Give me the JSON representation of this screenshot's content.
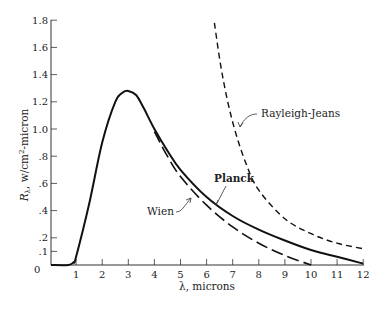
{
  "chart_data": {
    "type": "line",
    "title": "",
    "xlabel": "λ, microns",
    "ylabel": "Rλ, w/cm²-micron",
    "xlim": [
      0,
      12
    ],
    "ylim": [
      0,
      1.8
    ],
    "grid": false,
    "x_ticks": [
      "0",
      "1",
      "2",
      "3",
      "4",
      "5",
      "6",
      "7",
      "8",
      "9",
      "10",
      "11",
      "12"
    ],
    "y_ticks": [
      ".1",
      ".2",
      ".4",
      ".6",
      ".8",
      "1.0",
      "1.2",
      "1.4",
      "1.6",
      "1.8"
    ],
    "y_tick_values": [
      0.1,
      0.2,
      0.4,
      0.6,
      0.8,
      1.0,
      1.2,
      1.4,
      1.6,
      1.8
    ],
    "series": [
      {
        "name": "Planck",
        "style": "solid",
        "x": [
          0.7,
          0.9,
          1.0,
          1.5,
          2.0,
          2.5,
          2.8,
          3.0,
          3.3,
          3.6,
          4.0,
          4.5,
          5.0,
          6.0,
          7.0,
          8.0,
          9.0,
          10.0,
          11.0,
          12.0
        ],
        "y": [
          0.0,
          0.02,
          0.06,
          0.45,
          0.9,
          1.2,
          1.27,
          1.28,
          1.25,
          1.15,
          1.0,
          0.84,
          0.7,
          0.5,
          0.36,
          0.26,
          0.18,
          0.11,
          0.06,
          0.01
        ]
      },
      {
        "name": "Wien",
        "style": "long-dash",
        "x": [
          4.0,
          4.5,
          5.0,
          6.0,
          7.0,
          8.0,
          9.0,
          10.0
        ],
        "y": [
          0.98,
          0.8,
          0.65,
          0.44,
          0.28,
          0.16,
          0.07,
          0.0
        ]
      },
      {
        "name": "Rayleigh-Jeans",
        "style": "short-dash",
        "x": [
          6.3,
          6.6,
          7.0,
          7.5,
          8.0,
          9.0,
          10.0,
          11.0,
          12.0
        ],
        "y": [
          1.78,
          1.4,
          1.05,
          0.75,
          0.55,
          0.34,
          0.23,
          0.16,
          0.12
        ]
      }
    ],
    "annotations": [
      {
        "text": "Planck",
        "x": 7.5,
        "y": 0.9
      },
      {
        "text": "Wien",
        "x": 4.3,
        "y": 0.55
      },
      {
        "text": "Rayleigh-Jeans",
        "x": 8.5,
        "y": 1.05
      }
    ]
  },
  "labels": {
    "xlabel": "λ, microns",
    "ylabel_main": "R",
    "ylabel_sub": "λ",
    "ylabel_rest": ", w/cm",
    "ylabel_sup": "2",
    "ylabel_tail": "-micron",
    "planck": "Planck",
    "wien": "Wien",
    "rayleigh": "Rayleigh-Jeans",
    "origin": "0"
  }
}
